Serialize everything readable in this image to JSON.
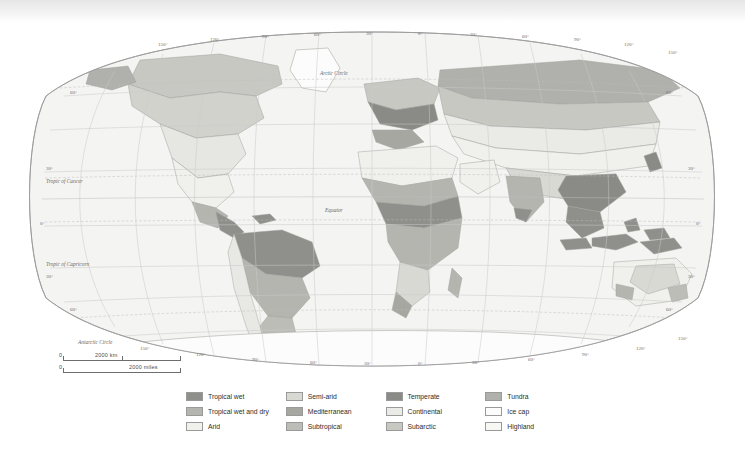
{
  "map": {
    "title": "World Climate Regions",
    "projection": "robinson",
    "graticule": {
      "longitude_labels_top": [
        "150°",
        "120°",
        "90°",
        "60°",
        "30°",
        "0°",
        "30°",
        "60°",
        "90°",
        "120°",
        "150°"
      ],
      "longitude_labels_bottom": [
        "150°",
        "120°",
        "90°",
        "60°",
        "30°",
        "0°",
        "30°",
        "60°",
        "90°",
        "120°",
        "150°"
      ],
      "latitude_labels_left": [
        "60°",
        "30°",
        "0°",
        "30°",
        "60°"
      ],
      "latitude_labels_right": [
        "60°",
        "30°",
        "0°",
        "30°",
        "60°"
      ]
    },
    "named_lines": {
      "arctic_circle": "Arctic Circle",
      "tropic_of_cancer": "Tropic of Cancer",
      "equator": "Equator",
      "tropic_of_capricorn": "Tropic of Capricorn",
      "antarctic_circle": "Antarctic Circle"
    },
    "scale": {
      "km_zero": "0",
      "km_value": "2000 km",
      "miles_zero": "0",
      "miles_value": "2000 miles"
    },
    "colors": {
      "ocean": "#f4f4f2",
      "graticule": "#c9c9c9",
      "outline": "#9b9b9b",
      "label": "#6a6a6a"
    }
  },
  "legend": {
    "items": [
      {
        "label": "Tropical wet",
        "color": "#8f8f8b"
      },
      {
        "label": "Semi-arid",
        "color": "#d9d9d4"
      },
      {
        "label": "Temperate",
        "color": "#8a8a86"
      },
      {
        "label": "Tundra",
        "color": "#b0b0ac"
      },
      {
        "label": "Tropical wet and dry",
        "color": "#b5b5b0"
      },
      {
        "label": "Mediterranean",
        "color": "#a7a7a2"
      },
      {
        "label": "Continental",
        "color": "#eaeae6"
      },
      {
        "label": "Ice cap",
        "color": "#fcfcfc"
      },
      {
        "label": "Arid",
        "color": "#f0f0ec"
      },
      {
        "label": "Subtropical",
        "color": "#bdbdb8"
      },
      {
        "label": "Subarctic",
        "color": "#c8c8c3"
      },
      {
        "label": "Highland",
        "color": "#f7f7f4"
      }
    ]
  }
}
